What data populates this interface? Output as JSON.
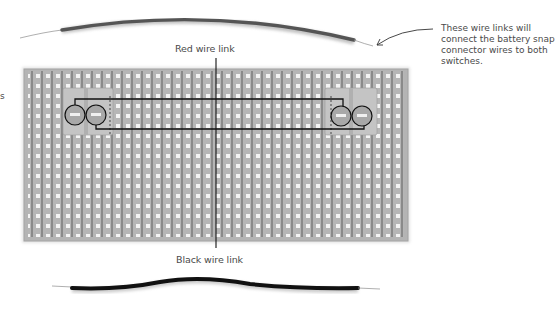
{
  "figure": {
    "colors": {
      "board": "#b4b4b4",
      "board_strip": "#8e8e8e",
      "hole": "#f2f2f2",
      "wire_red": "#555555",
      "wire_black": "#111111",
      "text": "#4a4a4a",
      "leader": "#111111"
    }
  },
  "labels": {
    "red_wire": "Red wire link",
    "black_wire": "Black wire link",
    "annotation": "These wire links will connect the battery snap connector wires to both switches.",
    "cropped_left": "s"
  },
  "components": {
    "board": {
      "x": 24,
      "y": 69,
      "width": 384,
      "height": 172,
      "columns": 38,
      "rows": 17,
      "pitch": 10
    },
    "switch_left": {
      "x": 63,
      "y": 88,
      "width": 50,
      "height": 47,
      "circles": [
        [
          75,
          115
        ],
        [
          96,
          115
        ]
      ]
    },
    "switch_right": {
      "x": 325,
      "y": 88,
      "width": 52,
      "height": 47,
      "circles": [
        [
          341,
          116
        ],
        [
          362,
          116
        ]
      ]
    },
    "wire_links": [
      "red-wire-link",
      "black-wire-link"
    ]
  }
}
